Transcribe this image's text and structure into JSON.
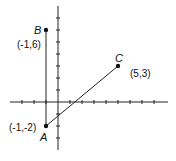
{
  "diagram": {
    "type": "coordinate-plane",
    "unit_px": 12,
    "origin_px": [
      58,
      102
    ],
    "points": [
      {
        "name": "A",
        "label": "A",
        "coords_label": "(-1,-2)",
        "x": -1,
        "y": -2
      },
      {
        "name": "B",
        "label": "B",
        "coords_label": "(-1,6)",
        "x": -1,
        "y": 6
      },
      {
        "name": "C",
        "label": "C",
        "coords_label": "(5,3)",
        "x": 5,
        "y": 3
      }
    ],
    "segments": [
      [
        "A",
        "B"
      ],
      [
        "A",
        "C"
      ]
    ],
    "x_range": [
      -2,
      8
    ],
    "y_range": [
      -4,
      8
    ]
  }
}
